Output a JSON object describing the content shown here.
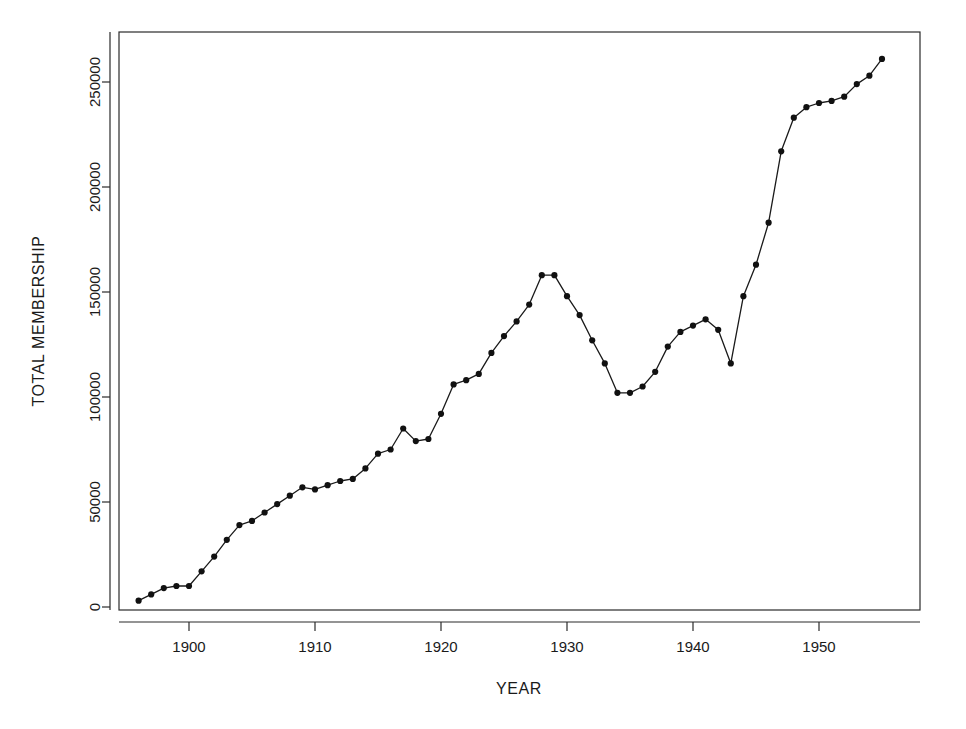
{
  "chart_data": {
    "type": "line",
    "title": "",
    "xlabel": "YEAR",
    "ylabel": "TOTAL MEMBERSHIP",
    "xlim": [
      1895,
      1956
    ],
    "ylim": [
      -8000,
      272000
    ],
    "xticks": [
      1900,
      1910,
      1920,
      1930,
      1940,
      1950
    ],
    "xticklabels": [
      "1900",
      "1910",
      "1920",
      "1930",
      "1940",
      "1950"
    ],
    "yticks": [
      0,
      50000,
      100000,
      150000,
      200000,
      250000
    ],
    "yticklabels": [
      "0",
      "50000",
      "100000",
      "150000",
      "200000",
      "250000"
    ],
    "grid": false,
    "legend": null,
    "marker": "filled-circle",
    "x": [
      1896,
      1897,
      1898,
      1899,
      1900,
      1901,
      1902,
      1903,
      1904,
      1905,
      1906,
      1907,
      1908,
      1909,
      1910,
      1911,
      1912,
      1913,
      1914,
      1915,
      1916,
      1917,
      1918,
      1919,
      1920,
      1921,
      1922,
      1923,
      1924,
      1925,
      1926,
      1927,
      1928,
      1929,
      1930,
      1931,
      1932,
      1933,
      1934,
      1935,
      1936,
      1937,
      1938,
      1939,
      1940,
      1941,
      1942,
      1943,
      1944,
      1945,
      1946,
      1947,
      1948,
      1949,
      1950,
      1951,
      1952,
      1953,
      1954,
      1955
    ],
    "y": [
      3000,
      6000,
      9000,
      10000,
      10000,
      17000,
      24000,
      32000,
      39000,
      41000,
      45000,
      49000,
      53000,
      57000,
      56000,
      58000,
      60000,
      61000,
      66000,
      73000,
      75000,
      85000,
      79000,
      80000,
      92000,
      106000,
      108000,
      111000,
      121000,
      129000,
      136000,
      144000,
      158000,
      158000,
      148000,
      139000,
      127000,
      116000,
      102000,
      102000,
      105000,
      112000,
      124000,
      131000,
      134000,
      137000,
      132000,
      116000,
      148000,
      163000,
      183000,
      217000,
      233000,
      238000,
      240000,
      241000,
      243000,
      249000,
      253000,
      261000
    ]
  },
  "axes": {
    "x_axis_name": "YEAR",
    "y_axis_name": "TOTAL MEMBERSHIP"
  }
}
